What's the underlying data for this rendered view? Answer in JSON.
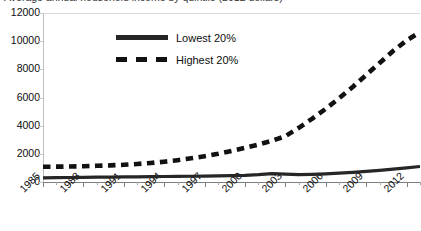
{
  "chart": {
    "title": "Average annual household income by quintile (2012 dollars)",
    "legend": {
      "position": "inside-top-left",
      "entries": [
        {
          "label": "Lowest 20%",
          "style": "solid",
          "color": "#262626"
        },
        {
          "label": "Highest 20%",
          "style": "dashed",
          "color": "#111111"
        }
      ]
    }
  },
  "chart_data": {
    "type": "line",
    "title": "Average annual household income by quintile (2012 dollars)",
    "xlabel": "",
    "ylabel": "",
    "xlim": [
      1985,
      2013
    ],
    "ylim": [
      0,
      12000
    ],
    "yticks": [
      0,
      2000,
      4000,
      6000,
      8000,
      10000,
      12000
    ],
    "ytick_labels": [
      "0",
      "2000",
      "4000",
      "6000",
      "8000",
      "10000",
      "12000"
    ],
    "xticks": [
      1985,
      1988,
      1991,
      1994,
      1997,
      2000,
      2003,
      2006,
      2009,
      2012
    ],
    "xtick_labels": [
      "1985",
      "1988",
      "1991",
      "1994",
      "1997",
      "2000",
      "2003",
      "2006",
      "2009",
      "2012"
    ],
    "xtick_minor_step": 1,
    "xtick_rotation": -45,
    "grid": false,
    "x": [
      1985,
      1986,
      1987,
      1988,
      1989,
      1990,
      1991,
      1992,
      1993,
      1994,
      1995,
      1996,
      1997,
      1998,
      1999,
      2000,
      2001,
      2002,
      2003,
      2004,
      2005,
      2006,
      2007,
      2008,
      2009,
      2010,
      2011,
      2012,
      2013
    ],
    "series": [
      {
        "name": "Lowest 20%",
        "style": "solid",
        "color": "#262626",
        "values": [
          300,
          310,
          320,
          330,
          340,
          350,
          360,
          370,
          380,
          390,
          400,
          410,
          420,
          430,
          450,
          470,
          520,
          600,
          560,
          520,
          540,
          580,
          630,
          690,
          760,
          830,
          910,
          1000,
          1100
        ]
      },
      {
        "name": "Highest 20%",
        "style": "dashed",
        "color": "#111111",
        "values": [
          1080,
          1090,
          1100,
          1120,
          1150,
          1180,
          1220,
          1280,
          1350,
          1440,
          1550,
          1680,
          1830,
          2000,
          2200,
          2420,
          2660,
          2930,
          3250,
          3850,
          4500,
          5200,
          5950,
          6750,
          7600,
          8450,
          9300,
          10050,
          10650
        ]
      }
    ]
  }
}
